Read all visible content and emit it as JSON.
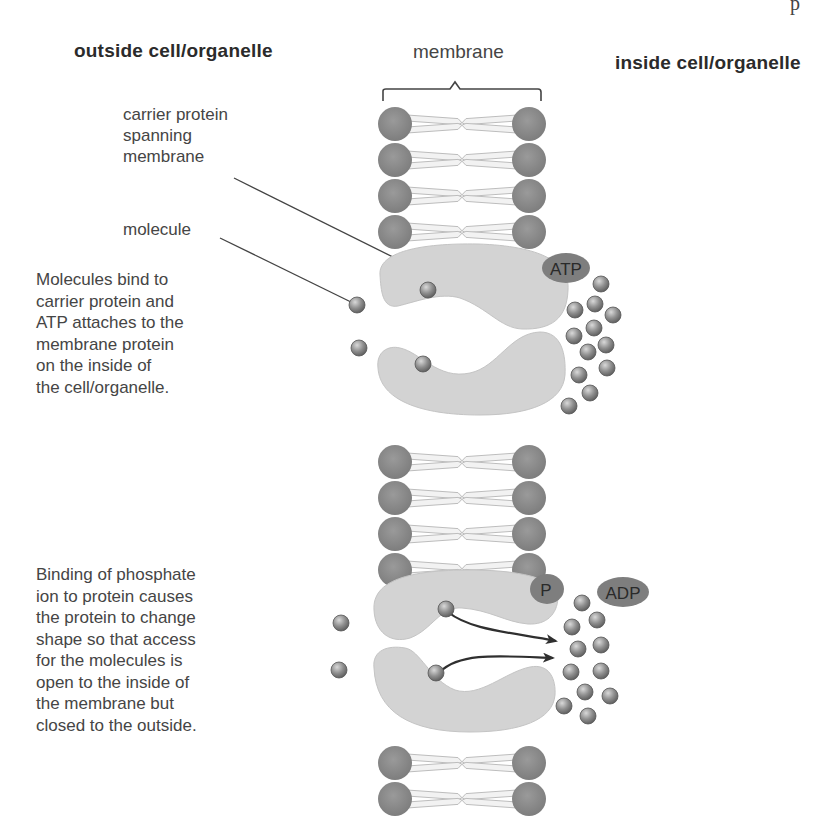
{
  "headings": {
    "outside": "outside cell/organelle",
    "inside": "inside cell/organelle",
    "membrane": "membrane"
  },
  "labels": {
    "carrier_protein": [
      "carrier protein",
      "spanning",
      "membrane"
    ],
    "molecule": "molecule"
  },
  "descriptions": {
    "step1": [
      "Molecules bind to",
      "carrier protein and",
      "ATP attaches to the",
      "membrane protein",
      "on the inside of",
      "the cell/organelle."
    ],
    "step2": [
      "Binding of phosphate",
      "ion to protein causes",
      "the protein to change",
      "shape so that access",
      "for the molecules is",
      "open to the inside of",
      "the membrane but",
      "closed to the outside."
    ]
  },
  "badges": {
    "atp": "ATP",
    "p": "P",
    "adp": "ADP"
  },
  "page_fragment": "p",
  "colors": {
    "phospholipid_head": "#8a8a8a",
    "lipid_tail_fill": "#f2f2f2",
    "lipid_tail_stroke": "#bdbdbd",
    "protein": "#d3d3d3",
    "protein_stroke": "#c4c4c4",
    "badge": "#7e7e7e",
    "molecule": "#8c8c8c",
    "arrow": "#2f2f2f",
    "leader_line": "#444444"
  },
  "diagram": {
    "membrane_bracket": {
      "x1": 383,
      "x2": 541,
      "y": 90,
      "peak_x": 455
    },
    "lipid_rows": [
      [
        124,
        160,
        196,
        232
      ],
      [
        462,
        498,
        534,
        570
      ],
      [
        763,
        799
      ]
    ],
    "lipid_head_left_x": 395,
    "lipid_head_right_x": 529,
    "lipid_head_r": 17,
    "molecules_step1_outside": [
      [
        357,
        305
      ],
      [
        359,
        348
      ]
    ],
    "molecules_step1_bound": [
      [
        428,
        290
      ],
      [
        423,
        364
      ]
    ],
    "molecules_step1_inside": [
      [
        601,
        284
      ],
      [
        575,
        310
      ],
      [
        595,
        304
      ],
      [
        613,
        315
      ],
      [
        574,
        336
      ],
      [
        594,
        328
      ],
      [
        606,
        345
      ],
      [
        588,
        352
      ],
      [
        607,
        368
      ],
      [
        579,
        375
      ],
      [
        590,
        393
      ],
      [
        569,
        406
      ]
    ],
    "molecules_step2_outside": [
      [
        341,
        623
      ],
      [
        339,
        670
      ]
    ],
    "molecules_step2_bound": [
      [
        446,
        609
      ],
      [
        436,
        673
      ]
    ],
    "molecules_step2_inside": [
      [
        582,
        603
      ],
      [
        597,
        620
      ],
      [
        572,
        627
      ],
      [
        578,
        649
      ],
      [
        601,
        645
      ],
      [
        571,
        672
      ],
      [
        601,
        671
      ],
      [
        585,
        692
      ],
      [
        610,
        696
      ],
      [
        564,
        706
      ],
      [
        588,
        716
      ]
    ]
  }
}
